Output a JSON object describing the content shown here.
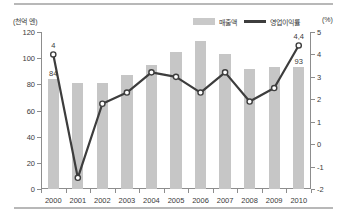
{
  "chart_data": {
    "type": "bar",
    "title": "",
    "subtitle": "",
    "categories": [
      "2000",
      "2001",
      "2002",
      "2003",
      "2004",
      "2005",
      "2006",
      "2007",
      "2008",
      "2009",
      "2010"
    ],
    "xlabel": "",
    "ylabel_left": "(천억 엔)",
    "ylabel_right": "(%)",
    "ylim_left": [
      0,
      120
    ],
    "ylim_right": [
      -2,
      5
    ],
    "yticks_left": [
      "0",
      "20",
      "40",
      "60",
      "80",
      "100",
      "120"
    ],
    "yticks_right": [
      "-2",
      "-1",
      "0",
      "1",
      "2",
      "3",
      "4",
      "5"
    ],
    "grid": false,
    "legend_position": "top-right",
    "series": [
      {
        "name": "매출액",
        "kind": "bar",
        "axis": "left",
        "color": "#c6c6c6",
        "values": [
          84,
          81,
          81,
          87,
          95,
          105,
          113,
          103,
          92,
          93,
          93
        ],
        "point_labels": [
          "84",
          "",
          "",
          "",
          "",
          "",
          "",
          "",
          "",
          "",
          "93"
        ]
      },
      {
        "name": "영업이익률",
        "kind": "line",
        "axis": "right",
        "color": "#3d3d3d",
        "values": [
          4.0,
          -1.5,
          1.8,
          2.3,
          3.2,
          3.0,
          2.3,
          3.2,
          1.9,
          2.5,
          4.4
        ],
        "point_labels": [
          "4",
          "",
          "",
          "",
          "",
          "",
          "",
          "",
          "",
          "",
          "4,4"
        ]
      }
    ]
  },
  "legend": {
    "bar_label": "매출액",
    "line_label": "영업이익률"
  },
  "axes": {
    "unit_left": "(천억 엔)",
    "unit_right": "(%)"
  }
}
